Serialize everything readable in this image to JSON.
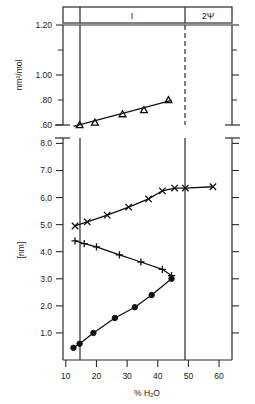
{
  "figure": {
    "region_labels": [
      "I",
      "2Ψ"
    ],
    "x_axis": {
      "label": "% H₂O",
      "ticks": [
        10,
        20,
        30,
        40,
        50,
        60
      ],
      "range": [
        5,
        67
      ]
    },
    "panels": [
      {
        "id": "top",
        "ylabel": "nm²/mol",
        "yticks": [
          ".60",
          ".80",
          "1.00",
          "1.20"
        ],
        "ylim": [
          0.55,
          1.24
        ]
      },
      {
        "id": "bottom",
        "ylabel": "[nm]",
        "yticks": [
          "1.0",
          "2.0",
          "3.0",
          "4.0",
          "5.0",
          "6.0",
          "7.0",
          "8.0"
        ],
        "ylim": [
          0.0,
          8.2
        ]
      }
    ]
  },
  "chart_data": [
    {
      "type": "scatter",
      "panel": "top",
      "title": "",
      "xlabel": "% H₂O",
      "ylabel": "nm²/mol",
      "ylim": [
        0.55,
        1.24
      ],
      "xlim": [
        5,
        67
      ],
      "yticks": [
        0.6,
        0.8,
        1.0,
        1.2
      ],
      "xticks": [
        10,
        20,
        30,
        40,
        50,
        60
      ],
      "grid": false,
      "legend": "none",
      "series": [
        {
          "name": "area per molecule",
          "marker": "open-triangle",
          "x": [
            14.5,
            19.5,
            28.5,
            35.5,
            43.5
          ],
          "values": [
            0.6,
            0.615,
            0.665,
            0.69,
            0.75
          ]
        }
      ],
      "fit_line": {
        "x": [
          12.5,
          44.5
        ],
        "y": [
          0.592,
          0.748
        ]
      }
    },
    {
      "type": "scatter",
      "panel": "bottom",
      "title": "",
      "xlabel": "% H₂O",
      "ylabel": "[nm]",
      "ylim": [
        0.0,
        8.2
      ],
      "xlim": [
        5,
        67
      ],
      "yticks": [
        1.0,
        2.0,
        3.0,
        4.0,
        5.0,
        6.0,
        7.0,
        8.0
      ],
      "xticks": [
        10,
        20,
        30,
        40,
        50,
        60
      ],
      "grid": false,
      "legend": "none",
      "series": [
        {
          "name": "d-spacing",
          "marker": "cross-x",
          "x": [
            13.0,
            17.0,
            23.5,
            30.5,
            37.0,
            41.5,
            45.5,
            49.0,
            58.0
          ],
          "values": [
            4.95,
            5.1,
            5.35,
            5.65,
            5.95,
            6.25,
            6.35,
            6.35,
            6.4
          ]
        },
        {
          "name": "lipid layer thickness",
          "marker": "plus",
          "x": [
            13.0,
            16.0,
            20.0,
            27.5,
            34.5,
            41.5,
            44.5
          ],
          "values": [
            4.4,
            4.3,
            4.18,
            3.88,
            3.62,
            3.35,
            3.12
          ]
        },
        {
          "name": "water layer thickness",
          "marker": "filled-circle",
          "x": [
            12.5,
            14.5,
            19.0,
            26.0,
            32.5,
            38.0,
            44.5
          ],
          "values": [
            0.45,
            0.6,
            1.0,
            1.55,
            1.95,
            2.4,
            3.0
          ]
        }
      ],
      "boundaries": [
        12.0,
        45.0
      ]
    }
  ]
}
